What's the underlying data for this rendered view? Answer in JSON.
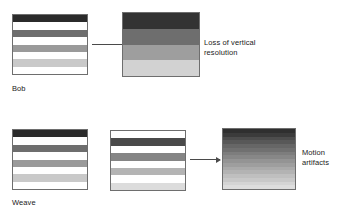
{
  "figure": {
    "background": "#ffffff",
    "frame_border_color": "#6e6e6e",
    "arrow_color": "#4a4a4a",
    "text_color": "#1a1a1a"
  },
  "rows": [
    {
      "method_label": "Bob",
      "input_frame": {
        "name": "bob-input-frame",
        "description": "interlaced field with black line gaps",
        "stripes": [
          "#2b2b2b",
          "#ffffff",
          "#6e6e6e",
          "#ffffff",
          "#9a9a9a",
          "#ffffff",
          "#c9c9c9",
          "#ffffff"
        ]
      },
      "output_frame": {
        "name": "bob-output-frame",
        "description": "line doubled, vertical resolution halved",
        "stripes": [
          "#333333",
          "#6e6e6e",
          "#9e9e9e",
          "#d2d2d2"
        ]
      },
      "annotation": "Loss of vertical\nresolution"
    },
    {
      "method_label": "Weave",
      "input_frame_a": {
        "name": "weave-input-frame-odd",
        "description": "odd field lines",
        "stripes": [
          "#2b2b2b",
          "#ffffff",
          "#6e6e6e",
          "#ffffff",
          "#9a9a9a",
          "#ffffff",
          "#c9c9c9",
          "#ffffff"
        ]
      },
      "input_frame_b": {
        "name": "weave-input-frame-even",
        "description": "even field lines, offset by one line",
        "stripes": [
          "#ffffff",
          "#4a4a4a",
          "#ffffff",
          "#858585",
          "#ffffff",
          "#b4b4b4",
          "#ffffff",
          "#dcdcdc"
        ]
      },
      "output_frame": {
        "name": "weave-output-frame",
        "description": "woven fields showing comb artifacts",
        "stripes": [
          "#2f2f2f",
          "#3b3b3b",
          "#4d4d4d",
          "#585858",
          "#666666",
          "#707070",
          "#7d7d7d",
          "#878787",
          "#949494",
          "#9e9e9e",
          "#aaaaaa",
          "#b3b3b3",
          "#bfbfbf",
          "#c8c8c8",
          "#d4d4d4",
          "#dddddd"
        ]
      },
      "annotation": "Motion\nartifacts"
    }
  ],
  "arrows": [
    {
      "name": "bob-arrow",
      "label": ""
    },
    {
      "name": "weave-arrow",
      "label": ""
    }
  ]
}
